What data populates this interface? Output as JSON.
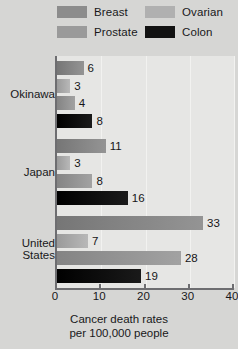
{
  "legend": {
    "items": [
      {
        "label": "Breast",
        "color": "#8c8c8c",
        "name": "legend-swatch-breast"
      },
      {
        "label": "Ovarian",
        "color": "#b0b0b0",
        "name": "legend-swatch-ovarian"
      },
      {
        "label": "Prostate",
        "color": "#9a9a9a",
        "name": "legend-swatch-prostate"
      },
      {
        "label": "Colon",
        "color": "#121212",
        "name": "legend-swatch-colon"
      }
    ]
  },
  "chart_data": {
    "type": "bar",
    "orientation": "horizontal",
    "title": "",
    "xlabel": "Cancer death rates per 100,000 people",
    "ylabel": "",
    "xlim": [
      0,
      40
    ],
    "xticks": [
      0,
      10,
      20,
      30,
      40
    ],
    "xtick_labels": [
      "0",
      "10",
      "20",
      "30",
      "40"
    ],
    "grid": true,
    "legend_position": "top",
    "categories": [
      "Okinawa",
      "Japan",
      "United States"
    ],
    "series": [
      {
        "name": "Breast",
        "color": "#8c8c8c",
        "values": [
          6,
          11,
          33
        ]
      },
      {
        "name": "Ovarian",
        "color": "#b0b0b0",
        "values": [
          3,
          3,
          7
        ]
      },
      {
        "name": "Prostate",
        "color": "#9a9a9a",
        "values": [
          4,
          8,
          28
        ]
      },
      {
        "name": "Colon",
        "color": "#121212",
        "values": [
          8,
          16,
          19
        ]
      }
    ]
  },
  "caption": {
    "line1": "Cancer death rates",
    "line2": "per 100,000 people"
  },
  "group_labels": {
    "okinawa": "Okinawa",
    "japan": "Japan",
    "united_states": "United\nStates"
  }
}
